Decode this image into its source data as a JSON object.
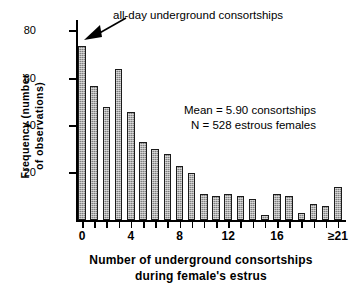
{
  "chart_data": {
    "type": "bar",
    "title": "",
    "subtitle": "",
    "xlabel": "Number of underground consortships during female's estrus",
    "xlabel_lines": [
      "Number  of  underground  consortships",
      "during  female's  estrus"
    ],
    "ylabel": "Frequency (number of observations)",
    "ylabel_lines": [
      "Frequency  (number",
      "of  observations)"
    ],
    "categories": [
      "0",
      "1",
      "2",
      "3",
      "4",
      "5",
      "6",
      "7",
      "8",
      "9",
      "10",
      "11",
      "12",
      "13",
      "14",
      "15",
      "16",
      "17",
      "18",
      "19",
      "20",
      "≥21"
    ],
    "values": [
      74,
      57,
      48,
      64,
      46,
      33,
      30,
      28,
      23,
      20,
      11,
      10,
      11,
      10,
      9,
      2,
      11,
      10,
      3,
      7,
      6,
      14
    ],
    "ylim": [
      0,
      84
    ],
    "yticks": [
      20,
      40,
      60,
      80
    ],
    "ytick_labels": [
      "20",
      "40",
      "60",
      "80"
    ],
    "xticks": [
      0,
      1,
      2,
      3,
      4,
      5,
      6,
      7,
      8,
      9,
      10,
      11,
      12,
      13,
      14,
      15,
      16,
      17,
      18,
      19,
      20,
      21
    ],
    "xtick_labels": [
      {
        "index": 0,
        "text": "0"
      },
      {
        "index": 4,
        "text": "4"
      },
      {
        "index": 8,
        "text": "8"
      },
      {
        "index": 12,
        "text": "12"
      },
      {
        "index": 16,
        "text": "16"
      },
      {
        "index": 21,
        "text": "≥21"
      }
    ],
    "grid": false,
    "legend": null,
    "bar_color": "#808080",
    "bar_edge_color": "#1a1a1a",
    "annotations": [
      {
        "name": "all-day-annotation",
        "text": "all-day  underground  consortships",
        "points_to_category": "0"
      },
      {
        "name": "mean-stat",
        "text": "Mean  =  5.90  consortships"
      },
      {
        "name": "n-stat",
        "text": "N  =  528  estrous  females"
      }
    ]
  },
  "annotation": {
    "callout": "all-day  underground  consortships"
  },
  "stats": {
    "mean_line": "Mean  =  5.90  consortships",
    "n_line": "N  =  528  estrous  females"
  }
}
